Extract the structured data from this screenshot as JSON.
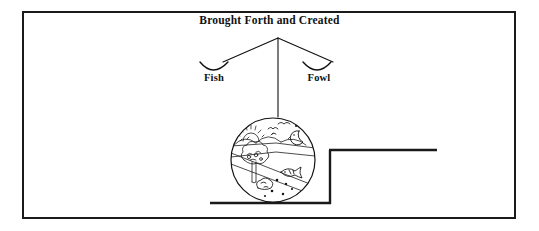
{
  "figure": {
    "title": "Brought Forth and Created",
    "branches": [
      {
        "label": "Fish",
        "side": "left"
      },
      {
        "label": "Fowl",
        "side": "right"
      }
    ],
    "illustration": {
      "name": "creation-scene-circle",
      "elements": [
        "sun-with-rays",
        "flying-birds",
        "crescent-moon",
        "stars",
        "hills",
        "water-surface",
        "tree",
        "swimming-fish",
        "rocks",
        "pebbles"
      ]
    },
    "colors": {
      "ink": "#1a1a1a",
      "line": "#111111",
      "background": "#ffffff"
    }
  }
}
